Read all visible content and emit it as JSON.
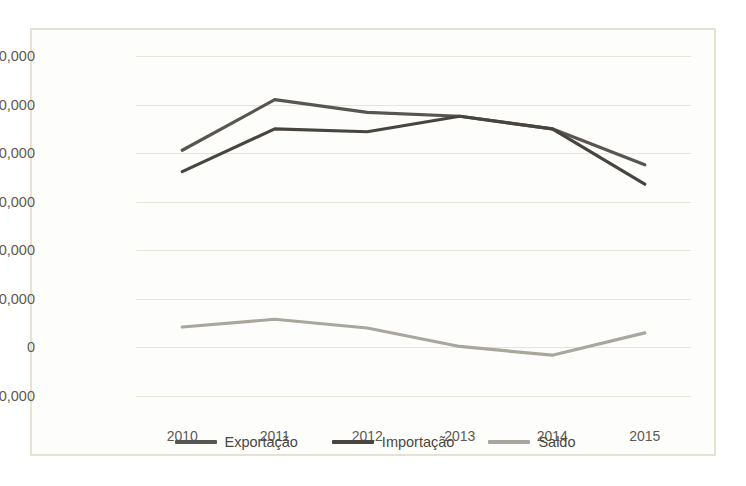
{
  "chart_data": {
    "type": "line",
    "title": "",
    "xlabel": "",
    "ylabel": "",
    "categories": [
      "2010",
      "2011",
      "2012",
      "2013",
      "2014",
      "2015"
    ],
    "ylim": [
      -50000,
      300000
    ],
    "y_ticks": [
      300000,
      250000,
      200000,
      150000,
      100000,
      50000,
      0,
      -50000
    ],
    "y_tick_labels": [
      "300,000",
      "250,000",
      "200,000",
      "150,000",
      "100,000",
      "50,000",
      "0",
      "-50,000"
    ],
    "grid": true,
    "legend_position": "bottom",
    "series": [
      {
        "name": "Exportação",
        "color": "#595651",
        "values": [
          203000,
          255000,
          242000,
          238000,
          225000,
          188000
        ]
      },
      {
        "name": "Importação",
        "color": "#484540",
        "values": [
          181000,
          225000,
          222000,
          238000,
          225000,
          168000
        ]
      },
      {
        "name": "Saldo",
        "color": "#a9a69e",
        "values": [
          21000,
          29000,
          20000,
          1000,
          -8000,
          15000
        ]
      }
    ]
  },
  "style": {
    "background": "#fdfdfb",
    "border_color": "#e6e2d3",
    "gridline_color": "#e8e4d6",
    "tick_label_color": "#5e5a53"
  }
}
